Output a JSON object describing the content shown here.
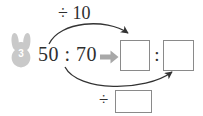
{
  "exercise": {
    "number": "3",
    "badge_icon": "rabbit-icon",
    "badge_color": "#c9c9c9"
  },
  "problem": {
    "ratio_text": "50 : 70",
    "implies_icon": "right-block-arrow-icon",
    "implies_color": "#a8a8a8",
    "ratio_colon": ":"
  },
  "operations": {
    "top_label": "÷ 10",
    "bottom_label": "÷",
    "top_arrow_icon": "curved-arrow-right-icon",
    "bottom_arrow_icon": "curved-arrow-right-icon",
    "arrow_color": "#333333"
  },
  "answers": {
    "box_1_value": "",
    "box_2_value": "",
    "box_3_value": "",
    "box_border_color": "#8a8a8a"
  },
  "colors": {
    "background": "#ffffff",
    "text": "#2e2e2e"
  }
}
